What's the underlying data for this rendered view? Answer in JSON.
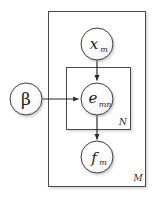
{
  "diagram": {
    "type": "plate-notation-graphical-model",
    "background_color": "#ffffff",
    "stroke_color": "#333333",
    "node_fill": "#fbfbfb",
    "nodes": [
      {
        "id": "beta",
        "label": "β",
        "subscript": "",
        "kind": "latent-variable",
        "shape": "circle",
        "cx": 26,
        "cy": 99,
        "r": 16
      },
      {
        "id": "x_m",
        "label": "x",
        "subscript": "m",
        "kind": "observed-variable",
        "shape": "circle",
        "cx": 97,
        "cy": 44,
        "r": 16
      },
      {
        "id": "e_mn",
        "label": "e",
        "subscript": "mn",
        "kind": "latent-variable",
        "shape": "circle",
        "cx": 97,
        "cy": 99,
        "r": 16
      },
      {
        "id": "f_m",
        "label": "f",
        "subscript": "m",
        "kind": "observed-variable",
        "shape": "circle",
        "cx": 97,
        "cy": 157,
        "r": 16
      }
    ],
    "edges": [
      {
        "id": "edge-x-to-e",
        "from": "x_m",
        "to": "e_mn",
        "direction": "down"
      },
      {
        "id": "edge-beta-to-e",
        "from": "beta",
        "to": "e_mn",
        "direction": "right"
      },
      {
        "id": "edge-e-to-f",
        "from": "e_mn",
        "to": "f_m",
        "direction": "down"
      }
    ],
    "plates": [
      {
        "id": "plate-outer",
        "label": "M",
        "x": 48,
        "y": 11,
        "width": 98,
        "height": 176,
        "label_x": 138,
        "label_y": 181
      },
      {
        "id": "plate-inner",
        "label": "N",
        "x": 66,
        "y": 67,
        "width": 65,
        "height": 63,
        "label_x": 123,
        "label_y": 125
      }
    ]
  }
}
